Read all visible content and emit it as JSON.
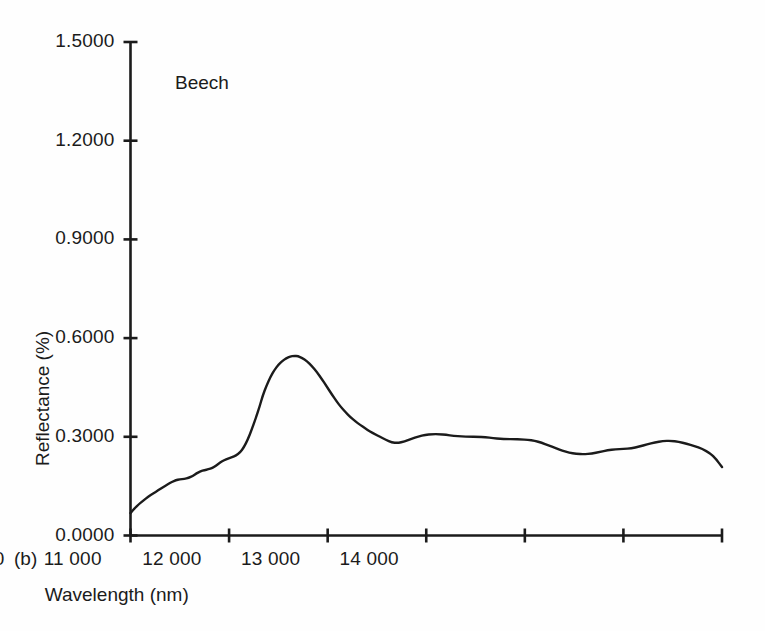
{
  "figure": {
    "panel_label": "(b)",
    "background_color": "#fefefe",
    "ink_color": "#1b1b1b"
  },
  "chart_data": {
    "type": "line",
    "title": "",
    "subtitle": "",
    "annotation": "Beech",
    "xlabel": "Wavelength (nm)",
    "ylabel": "Reflectance (%)",
    "xlim": [
      8000,
      14000
    ],
    "ylim": [
      0.0,
      1.5
    ],
    "grid": false,
    "legend": null,
    "legend_position": "none",
    "xticks": [
      8000,
      9000,
      10000,
      11000,
      12000,
      13000,
      14000
    ],
    "xticklabels": [
      "8000.0",
      "9000.0",
      "10 000",
      "11 000",
      "12 000",
      "13 000",
      "14 000"
    ],
    "yticks": [
      0.0,
      0.3,
      0.6,
      0.9,
      1.2,
      1.5
    ],
    "yticklabels": [
      "0.0000",
      "0.3000",
      "0.6000",
      "0.9000",
      "1.2000",
      "1.5000"
    ],
    "series": [
      {
        "name": "Beech",
        "color": "#1b1b1b",
        "linewidth": 2.4,
        "x": [
          8000,
          8040,
          8085,
          8130,
          8180,
          8230,
          8280,
          8330,
          8380,
          8420,
          8460,
          8500,
          8545,
          8590,
          8630,
          8670,
          8710,
          8750,
          8790,
          8830,
          8870,
          8910,
          8950,
          8990,
          9030,
          9070,
          9110,
          9150,
          9190,
          9230,
          9270,
          9310,
          9340,
          9380,
          9420,
          9460,
          9500,
          9540,
          9580,
          9620,
          9660,
          9700,
          9740,
          9790,
          9840,
          9890,
          9940,
          9990,
          10040,
          10090,
          10130,
          10180,
          10230,
          10280,
          10330,
          10380,
          10430,
          10480,
          10530,
          10590,
          10650,
          10710,
          10780,
          10850,
          10920,
          10990,
          11060,
          11130,
          11200,
          11280,
          11360,
          11440,
          11520,
          11600,
          11680,
          11750,
          11820,
          11890,
          11960,
          12030,
          12100,
          12170,
          12240,
          12310,
          12380,
          12450,
          12520,
          12600,
          12680,
          12760,
          12840,
          12920,
          13000,
          13080,
          13160,
          13240,
          13320,
          13400,
          13480,
          13560,
          13640,
          13720,
          13800,
          13880,
          13940,
          14000
        ],
        "y": [
          0.068,
          0.082,
          0.095,
          0.106,
          0.118,
          0.128,
          0.137,
          0.147,
          0.156,
          0.163,
          0.168,
          0.171,
          0.172,
          0.175,
          0.181,
          0.189,
          0.195,
          0.199,
          0.201,
          0.205,
          0.213,
          0.222,
          0.229,
          0.234,
          0.238,
          0.243,
          0.252,
          0.268,
          0.292,
          0.322,
          0.356,
          0.392,
          0.424,
          0.456,
          0.482,
          0.503,
          0.519,
          0.53,
          0.539,
          0.544,
          0.546,
          0.545,
          0.54,
          0.53,
          0.515,
          0.497,
          0.476,
          0.453,
          0.43,
          0.408,
          0.392,
          0.375,
          0.36,
          0.347,
          0.336,
          0.326,
          0.316,
          0.308,
          0.3,
          0.291,
          0.283,
          0.281,
          0.286,
          0.294,
          0.301,
          0.306,
          0.308,
          0.308,
          0.306,
          0.303,
          0.301,
          0.3,
          0.3,
          0.299,
          0.296,
          0.294,
          0.293,
          0.293,
          0.292,
          0.291,
          0.288,
          0.282,
          0.274,
          0.266,
          0.258,
          0.252,
          0.248,
          0.247,
          0.249,
          0.254,
          0.259,
          0.262,
          0.263,
          0.265,
          0.27,
          0.277,
          0.283,
          0.287,
          0.288,
          0.285,
          0.279,
          0.272,
          0.263,
          0.25,
          0.232,
          0.208
        ]
      }
    ]
  }
}
